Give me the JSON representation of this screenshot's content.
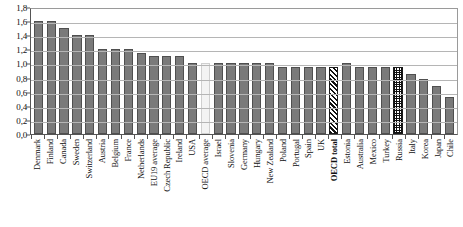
{
  "chart_data": {
    "type": "bar",
    "title": "",
    "subtitle": "",
    "xlabel": "",
    "ylabel": "",
    "ylim": [
      0.0,
      1.8
    ],
    "ytick_step": 0.2,
    "grid": true,
    "legend": "none",
    "decimal_separator": ",",
    "ytick_labels": [
      "1,8",
      "1,6",
      "1,4",
      "1,2",
      "1,0",
      "0,8",
      "0,6",
      "0,4",
      "0,2",
      "0,0"
    ],
    "ytick_values": [
      1.8,
      1.6,
      1.4,
      1.2,
      1.0,
      0.8,
      0.6,
      0.4,
      0.2,
      0.0
    ],
    "categories": [
      "Denmark",
      "Finland",
      "Canada",
      "Sweden",
      "Switzerland",
      "Austria",
      "Belgium",
      "France",
      "Netherlands",
      "EU19 average",
      "Czech Republic",
      "Ireland",
      "USA",
      "OECD average",
      "Israel",
      "Slovenia",
      "Germany",
      "Hungary",
      "New Zealand",
      "Poland",
      "Portugal",
      "Spain",
      "UK",
      "OECD total",
      "Estonia",
      "Australia",
      "Mexico",
      "Turkey",
      "Russia",
      "Italy",
      "Korea",
      "Japan",
      "Chile"
    ],
    "values": [
      1.6,
      1.6,
      1.5,
      1.4,
      1.4,
      1.2,
      1.2,
      1.2,
      1.15,
      1.1,
      1.1,
      1.1,
      1.0,
      1.0,
      1.0,
      1.0,
      1.0,
      1.0,
      1.0,
      0.95,
      0.95,
      0.95,
      0.95,
      0.95,
      1.0,
      0.95,
      0.95,
      0.95,
      0.95,
      0.85,
      0.78,
      0.68,
      0.52
    ],
    "styles": [
      "solid",
      "solid",
      "solid",
      "solid",
      "solid",
      "solid",
      "solid",
      "solid",
      "solid",
      "solid",
      "solid",
      "solid",
      "solid",
      "light",
      "solid",
      "solid",
      "solid",
      "solid",
      "solid",
      "solid",
      "solid",
      "solid",
      "solid",
      "hatch",
      "solid",
      "solid",
      "solid",
      "solid",
      "dots",
      "solid",
      "solid",
      "solid",
      "solid"
    ],
    "emphasized_labels": [
      "OECD total"
    ],
    "colors": {
      "bar_solid": "#7a7a7a",
      "bar_solid_border": "#4f4f4f",
      "bar_light": "#f3f3f3",
      "bar_pattern_ink": "#111111",
      "gridline": "#b5b5b5",
      "axis": "#555555",
      "plot_background": "#ffffff",
      "text": "#111111"
    }
  }
}
